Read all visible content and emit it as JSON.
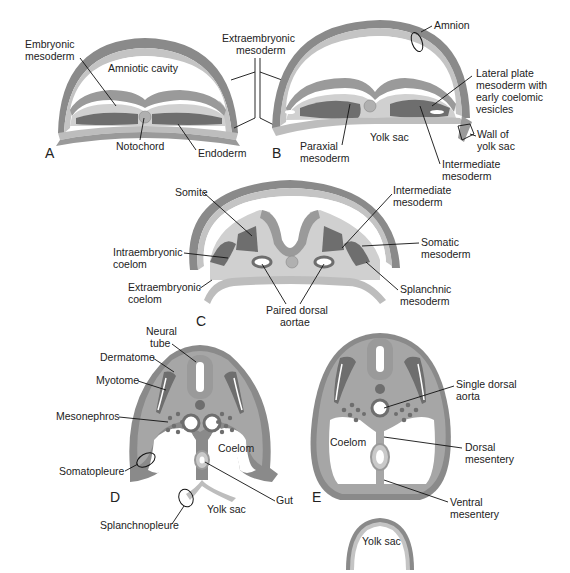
{
  "figure": {
    "panels": [
      "A",
      "B",
      "C",
      "D",
      "E"
    ],
    "colors": {
      "outer_layer": "#8a8a8a",
      "outer_inner": "#bdbdbd",
      "ectoderm": "#9a9a9a",
      "mesoderm": "#6e6e6e",
      "light_tissue": "#c9c9c9",
      "cavity": "#ffffff",
      "notochord": "#b0b0b0",
      "text": "#222222"
    }
  },
  "labels": {
    "A": {
      "embryonic_mesoderm": [
        "Embryonic",
        "mesoderm"
      ],
      "amniotic_cavity": "Amniotic cavity",
      "notochord": "Notochord",
      "endoderm": "Endoderm"
    },
    "AB": {
      "extraembryonic_mesoderm": [
        "Extraembryonic",
        "mesoderm"
      ]
    },
    "B": {
      "amnion": "Amnion",
      "lateral_plate": [
        "Lateral plate",
        "mesoderm with",
        "early coelomic",
        "vesicles"
      ],
      "wall_yolk_sac": [
        "Wall of",
        "yolk sac"
      ],
      "yolk_sac": "Yolk sac",
      "paraxial_mesoderm": [
        "Paraxial",
        "mesoderm"
      ],
      "intermediate_mesoderm": [
        "Intermediate",
        "mesoderm"
      ]
    },
    "C": {
      "somite": "Somite",
      "intermediate_mesoderm": [
        "Intermediate",
        "mesoderm"
      ],
      "intraembryonic_coelom": [
        "Intraembryonic",
        "coelom"
      ],
      "somatic_mesoderm": [
        "Somatic",
        "mesoderm"
      ],
      "extraembryonic_coelom": [
        "Extraembryonic",
        "coelom"
      ],
      "splanchnic_mesoderm": [
        "Splanchnic",
        "mesoderm"
      ],
      "paired_dorsal_aortae": [
        "Paired dorsal",
        "aortae"
      ]
    },
    "D": {
      "neural_tube": [
        "Neural",
        "tube"
      ],
      "dermatome": "Dermatome",
      "myotome": "Myotome",
      "mesonephros": "Mesonephros",
      "coelom": "Coelom",
      "somatopleure": "Somatopleure",
      "gut": "Gut",
      "yolk_sac": "Yolk sac",
      "splanchnopleure": "Splanchnopleure"
    },
    "E": {
      "single_dorsal_aorta": [
        "Single dorsal",
        "aorta"
      ],
      "coelom": "Coelom",
      "dorsal_mesentery": [
        "Dorsal",
        "mesentery"
      ],
      "ventral_mesentery": [
        "Ventral",
        "mesentery"
      ],
      "yolk_sac": "Yolk sac"
    }
  }
}
